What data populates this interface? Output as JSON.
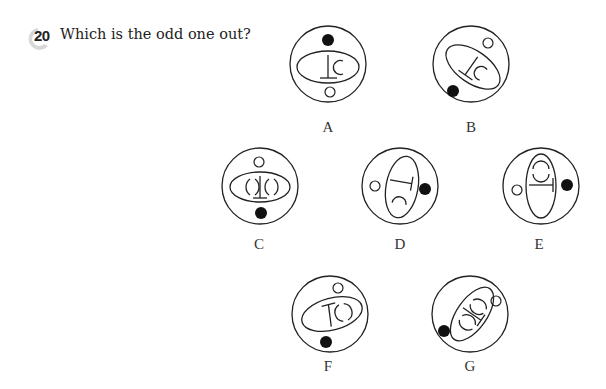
{
  "question": {
    "number": "20",
    "text": "Which is the odd one out?"
  },
  "options": [
    {
      "id": "A",
      "label": "A",
      "ellipse_rotation_deg": 0,
      "tbar": "vertical-stem-base-down",
      "arcs": [
        "right"
      ],
      "white_dot": "bottom",
      "black_dot": "top"
    },
    {
      "id": "B",
      "label": "B",
      "ellipse_rotation_deg": -40,
      "tbar": "rotated",
      "arcs": [
        "right"
      ],
      "white_dot": "top-right",
      "black_dot": "bottom-left"
    },
    {
      "id": "C",
      "label": "C",
      "ellipse_rotation_deg": 0,
      "tbar": "vertical-stem-base-down",
      "arcs": [
        "left",
        "right"
      ],
      "white_dot": "top",
      "black_dot": "bottom"
    },
    {
      "id": "D",
      "label": "D",
      "ellipse_rotation_deg": 80,
      "tbar": "rotated",
      "arcs": [
        "bottom"
      ],
      "white_dot": "left",
      "black_dot": "right"
    },
    {
      "id": "E",
      "label": "E",
      "ellipse_rotation_deg": 90,
      "tbar": "horizontal",
      "arcs": [
        "top"
      ],
      "white_dot": "left",
      "black_dot": "right"
    },
    {
      "id": "F",
      "label": "F",
      "ellipse_rotation_deg": -15,
      "tbar": "T-shape-top",
      "arcs": [
        "right"
      ],
      "white_dot": "top",
      "black_dot": "bottom"
    },
    {
      "id": "G",
      "label": "G",
      "ellipse_rotation_deg": -55,
      "tbar": "rotated",
      "arcs": [
        "top",
        "bottom"
      ],
      "white_dot": "right",
      "black_dot": "left"
    }
  ],
  "colors": {
    "stroke": "#222222",
    "fill_black": "#111111",
    "badge": "#cfcfcf"
  }
}
